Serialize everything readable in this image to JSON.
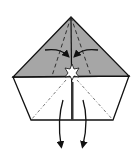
{
  "diagram": {
    "type": "origami-fold-step",
    "colors": {
      "background": "#ffffff",
      "colored_side": "#a6a6a6",
      "white_side": "#ffffff",
      "line": "#111111"
    },
    "elements": [
      "pentagon-paper",
      "shaded-top-triangle",
      "center-crease",
      "valley-fold-dashes",
      "inward-arrows",
      "star-point-marker",
      "downward-pull-arrows"
    ]
  }
}
